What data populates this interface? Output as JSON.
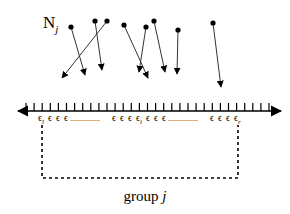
{
  "diagram": {
    "set_label": {
      "main": "N",
      "subscript": "j"
    },
    "group_label": {
      "main": "group ",
      "italic": "j"
    },
    "epsilon_labels": {
      "left": {
        "symbol": "ϵ",
        "subscript": "l"
      },
      "middle": {
        "symbol": "ϵ",
        "subscript": "i"
      },
      "right": {
        "symbol": "ϵ",
        "subscript": "r"
      },
      "sequence_symbol": "ϵ",
      "ellipsis": "..............."
    },
    "axis": {
      "y": 111,
      "x_start": 18,
      "x_end": 281,
      "tick_spacing": 8.1,
      "tick_count": 32,
      "tick_height": 8,
      "color": "#000000"
    },
    "arrows": [
      {
        "from": [
          71,
          27
        ],
        "to": [
          85,
          75
        ]
      },
      {
        "from": [
          95,
          21
        ],
        "to": [
          102,
          70
        ]
      },
      {
        "from": [
          107,
          21
        ],
        "to": [
          62,
          78
        ]
      },
      {
        "from": [
          124,
          25
        ],
        "to": [
          148,
          78
        ]
      },
      {
        "from": [
          146,
          27
        ],
        "to": [
          139,
          72
        ]
      },
      {
        "from": [
          154,
          21
        ],
        "to": [
          165,
          72
        ]
      },
      {
        "from": [
          178,
          30
        ],
        "to": [
          177,
          74
        ]
      },
      {
        "from": [
          213,
          23
        ],
        "to": [
          221,
          87
        ]
      }
    ],
    "group_box": {
      "x1": 42,
      "y1": 125,
      "x2": 238,
      "y2": 178,
      "style": "dashed"
    },
    "colors": {
      "ink": "#000000",
      "arrow": "#333333",
      "background": "#ffffff"
    }
  }
}
